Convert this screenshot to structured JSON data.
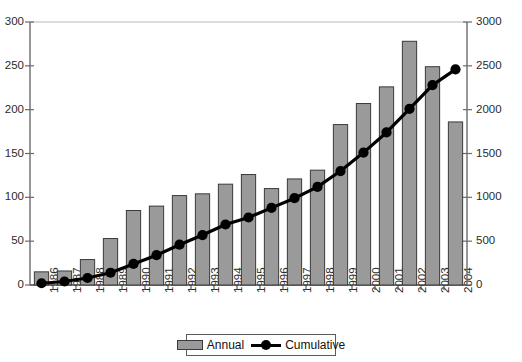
{
  "chart_data": {
    "type": "bar",
    "title": "",
    "subtitle": "",
    "xlabel": "",
    "ylabel": "",
    "y2label": "",
    "grid": false,
    "legend_position": "bottom-center",
    "categories": [
      "1986",
      "1987",
      "1988",
      "1989",
      "1990",
      "1991",
      "1992",
      "1993",
      "1994",
      "1995",
      "1996",
      "1997",
      "1998",
      "1999",
      "2000",
      "2001",
      "2002",
      "2003",
      "2004"
    ],
    "series": [
      {
        "name": "Annual",
        "type": "bar",
        "axis": "left",
        "color": "#9a9a9a",
        "values": [
          15,
          16,
          29,
          53,
          85,
          90,
          102,
          104,
          115,
          126,
          110,
          121,
          131,
          183,
          207,
          226,
          278,
          249,
          186
        ]
      },
      {
        "name": "Cumulative",
        "type": "line",
        "axis": "right",
        "color": "#000000",
        "values": [
          20,
          40,
          80,
          140,
          240,
          340,
          460,
          570,
          690,
          770,
          880,
          990,
          1120,
          1300,
          1510,
          1740,
          2010,
          2280,
          2460
        ]
      }
    ],
    "ylim": [
      0,
      300
    ],
    "yticks": [
      0,
      50,
      100,
      150,
      200,
      250,
      300
    ],
    "y2lim": [
      0,
      3000
    ],
    "y2ticks": [
      0,
      500,
      1000,
      1500,
      2000,
      2500,
      3000
    ]
  },
  "legend": {
    "annual_label": "Annual",
    "cumulative_label": "Cumulative"
  }
}
